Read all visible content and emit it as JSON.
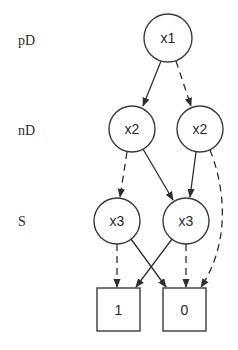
{
  "levels": [
    {
      "id": "pD",
      "label": "pD"
    },
    {
      "id": "nD",
      "label": "nD"
    },
    {
      "id": "S",
      "label": "S"
    }
  ],
  "nodes": [
    {
      "id": "n_x1",
      "label": "x1",
      "shape": "circle",
      "level": "pD"
    },
    {
      "id": "n_x2a",
      "label": "x2",
      "shape": "circle",
      "level": "nD"
    },
    {
      "id": "n_x2b",
      "label": "x2",
      "shape": "circle",
      "level": "nD"
    },
    {
      "id": "n_x3a",
      "label": "x3",
      "shape": "circle",
      "level": "S"
    },
    {
      "id": "n_x3b",
      "label": "x3",
      "shape": "circle",
      "level": "S"
    },
    {
      "id": "t1",
      "label": "1",
      "shape": "box",
      "level": "terminal"
    },
    {
      "id": "t0",
      "label": "0",
      "shape": "box",
      "level": "terminal"
    }
  ],
  "edges": [
    {
      "from": "n_x1",
      "to": "n_x2a",
      "style": "solid"
    },
    {
      "from": "n_x1",
      "to": "n_x2b",
      "style": "dashed"
    },
    {
      "from": "n_x2a",
      "to": "n_x3a",
      "style": "dashed"
    },
    {
      "from": "n_x2a",
      "to": "n_x3b",
      "style": "solid"
    },
    {
      "from": "n_x2b",
      "to": "n_x3b",
      "style": "solid"
    },
    {
      "from": "n_x2b",
      "to": "t0",
      "style": "dashed"
    },
    {
      "from": "n_x3a",
      "to": "t1",
      "style": "dashed"
    },
    {
      "from": "n_x3a",
      "to": "t0",
      "style": "solid"
    },
    {
      "from": "n_x3b",
      "to": "t1",
      "style": "solid"
    },
    {
      "from": "n_x3b",
      "to": "t0",
      "style": "dashed"
    }
  ]
}
